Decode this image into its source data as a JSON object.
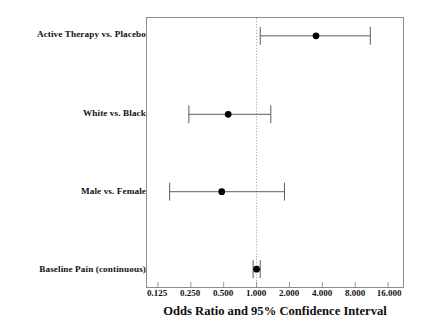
{
  "chart_data": {
    "type": "scatter",
    "subtype": "forest-plot",
    "title": "",
    "xlabel": "Odds Ratio and 95% Confidence Interval",
    "ylabel": "",
    "xscale": "log2",
    "xlim": [
      0.125,
      16.0
    ],
    "grid": false,
    "legend": null,
    "reference_line": {
      "value": 1.0,
      "style": "dotted",
      "orientation": "vertical",
      "color": "#999999"
    },
    "xticks": [
      0.125,
      0.25,
      0.5,
      1.0,
      2.0,
      4.0,
      8.0,
      16.0
    ],
    "xtick_labels": [
      "0.125",
      "0.250",
      "0.500",
      "1.000",
      "2.000",
      "4.000",
      "8.000",
      "16.000"
    ],
    "categories": [
      "Active Therapy vs. Placebo",
      "White vs. Black",
      "Male vs. Female",
      "Baseline Pain (continuous)"
    ],
    "points": [
      {
        "label": "Active Therapy vs. Placebo",
        "odds_ratio": 3.5,
        "ci_low": 1.08,
        "ci_high": 11.0,
        "marker": "filled-circle",
        "color": "#000000"
      },
      {
        "label": "White vs. Black",
        "odds_ratio": 0.55,
        "ci_low": 0.24,
        "ci_high": 1.35,
        "marker": "filled-circle",
        "color": "#000000"
      },
      {
        "label": "Male vs. Female",
        "odds_ratio": 0.48,
        "ci_low": 0.16,
        "ci_high": 1.8,
        "marker": "filled-circle",
        "color": "#000000"
      },
      {
        "label": "Baseline Pain (continuous)",
        "odds_ratio": 1.0,
        "ci_low": 0.93,
        "ci_high": 1.08,
        "marker": "filled-circle",
        "color": "#000000"
      }
    ]
  },
  "axis": {
    "x_title": "Odds Ratio and 95% Confidence Interval",
    "tick_labels": [
      "0.125",
      "0.250",
      "0.500",
      "1.000",
      "2.000",
      "4.000",
      "8.000",
      "16.000"
    ]
  },
  "rows": [
    {
      "label": "Active Therapy vs. Placebo"
    },
    {
      "label": "White vs. Black"
    },
    {
      "label": "Male vs. Female"
    },
    {
      "label": "Baseline Pain (continuous)"
    }
  ],
  "colors": {
    "marker": "#000000",
    "whisker": "#4a4a4a",
    "frame": "#8c8c8c",
    "reference_line": "#9a9a9a",
    "text": "#111111",
    "background": "#ffffff"
  }
}
